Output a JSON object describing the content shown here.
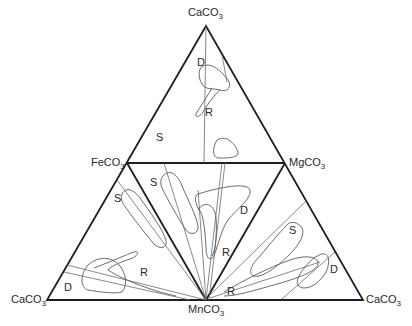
{
  "diagram": {
    "type": "ternary-carbonate-composition",
    "vertices": {
      "top": {
        "label": "CaCO",
        "sub": "3"
      },
      "left_mid": {
        "label": "FeCO",
        "sub": "3"
      },
      "right_mid": {
        "label": "MgCO",
        "sub": "3"
      },
      "bottom_left": {
        "label": "CaCO",
        "sub": "3"
      },
      "bottom_center": {
        "label": "MnCO",
        "sub": "3"
      },
      "bottom_right": {
        "label": "CaCO",
        "sub": "3"
      }
    },
    "sub_triangles": [
      {
        "name": "CaCO3-FeCO3-MgCO3",
        "fields": [
          "D",
          "R",
          "S"
        ]
      },
      {
        "name": "FeCO3-MgCO3-MnCO3",
        "fields": [
          "S",
          "D",
          "R"
        ]
      },
      {
        "name": "CaCO3-FeCO3-MnCO3",
        "fields": [
          "S",
          "R",
          "D"
        ]
      },
      {
        "name": "MgCO3-CaCO3-MnCO3",
        "fields": [
          "S",
          "D",
          "R"
        ]
      }
    ],
    "field_labels": {
      "top_D": "D",
      "top_R": "R",
      "top_S": "S",
      "center_S": "S",
      "center_D": "D",
      "center_R": "R",
      "left_S": "S",
      "left_R": "R",
      "left_D": "D",
      "right_S": "S",
      "right_D": "D",
      "right_R": "R"
    }
  }
}
